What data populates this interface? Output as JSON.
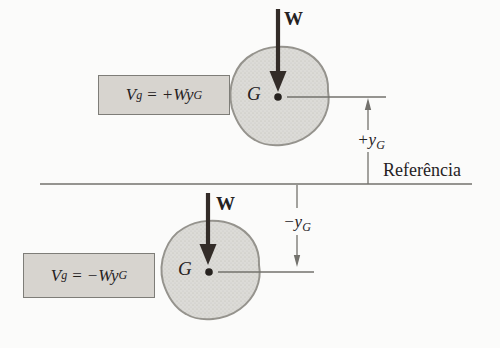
{
  "colors": {
    "bg": "#fbfbfa",
    "ink": "#26221f",
    "arrow": "#332c28",
    "line": "#73726d",
    "blob_fill": "#dcdbd7",
    "blob_dot": "#9e9d97",
    "blob_edge": "#95938d",
    "box_fill": "#d7d4cf",
    "box_border": "#7e7d78"
  },
  "reference": {
    "label": "Referência"
  },
  "top": {
    "formula": {
      "lhs": "V",
      "lhs_sub": "g",
      "eq": "=",
      "rhs": "+Wy",
      "rhs_sub": "G"
    },
    "weight_label": "W",
    "gravity_label": "G",
    "dim": {
      "base": "+y",
      "sub": "G"
    }
  },
  "bottom": {
    "formula": {
      "lhs": "V",
      "lhs_sub": "g",
      "eq": "=",
      "rhs": "−Wy",
      "rhs_sub": "G"
    },
    "weight_label": "W",
    "gravity_label": "G",
    "dim": {
      "base": "−y",
      "sub": "G"
    }
  }
}
